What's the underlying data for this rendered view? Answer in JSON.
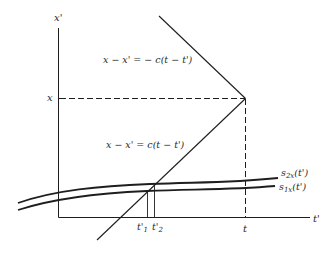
{
  "diagram": {
    "type": "spacetime light-cone diagram",
    "colors": {
      "ink": "#1e1e1e",
      "background": "#ffffff"
    },
    "axes": {
      "vertical_label": "x'",
      "horizontal_label": "t'",
      "vertical_tick_label": "x",
      "horizontal_tick_label": "t"
    },
    "lines": {
      "upper_equation": "x − x' = − c(t − t')",
      "lower_equation": "x − x' = c(t − t')"
    },
    "curves": [
      {
        "name": "s2x",
        "label_main": "s",
        "label_sub": "2x",
        "label_arg": "(t')"
      },
      {
        "name": "s1x",
        "label_main": "s",
        "label_sub": "1x",
        "label_arg": "(t')"
      }
    ],
    "intersections": [
      {
        "label_main": "t'",
        "label_sub": "1"
      },
      {
        "label_main": "t'",
        "label_sub": "2"
      }
    ]
  }
}
